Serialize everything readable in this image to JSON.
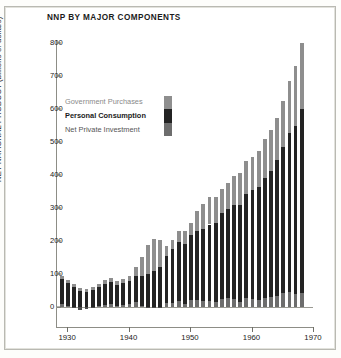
{
  "chart_data": {
    "type": "bar",
    "stacked": true,
    "title": "NNP BY MAJOR  COMPONENTS",
    "xlabel": "",
    "ylabel": "NET NATIONAL PRODUCT (billions of dollars)",
    "ylim": [
      0,
      820
    ],
    "xlim": [
      1928.2,
      1970
    ],
    "grid": false,
    "legend_position": "inside-upper-left",
    "y_ticks": [
      0,
      100,
      200,
      300,
      400,
      500,
      600,
      700,
      800
    ],
    "x_ticks": [
      1930,
      1940,
      1950,
      1960,
      1970
    ],
    "categories": [
      1929,
      1930,
      1931,
      1932,
      1933,
      1934,
      1935,
      1936,
      1937,
      1938,
      1939,
      1940,
      1941,
      1942,
      1943,
      1944,
      1945,
      1946,
      1947,
      1948,
      1949,
      1950,
      1951,
      1952,
      1953,
      1954,
      1955,
      1956,
      1957,
      1958,
      1959,
      1960,
      1961,
      1962,
      1963,
      1964,
      1965,
      1966,
      1967,
      1968
    ],
    "series": [
      {
        "name": "Net Private Investment",
        "color": "#6d6d6d",
        "stack_order": 1,
        "values": [
          9,
          3,
          -3,
          -8,
          -6,
          -1,
          4,
          7,
          10,
          2,
          5,
          9,
          14,
          4,
          -3,
          -2,
          -3,
          12,
          12,
          19,
          10,
          22,
          21,
          17,
          17,
          16,
          25,
          26,
          24,
          16,
          26,
          24,
          22,
          28,
          30,
          33,
          42,
          46,
          39,
          42
        ]
      },
      {
        "name": "Personal Consumption",
        "color": "#232323",
        "stack_order": 2,
        "values": [
          77,
          70,
          61,
          49,
          46,
          52,
          56,
          62,
          67,
          64,
          67,
          71,
          81,
          89,
          100,
          109,
          120,
          144,
          165,
          178,
          181,
          195,
          209,
          219,
          233,
          240,
          259,
          271,
          285,
          294,
          317,
          332,
          342,
          363,
          383,
          412,
          444,
          481,
          509,
          558
        ]
      },
      {
        "name": "Government Purchases",
        "color": "#8e8e8e",
        "stack_order": 3,
        "values": [
          9,
          10,
          9,
          8,
          8,
          10,
          10,
          12,
          12,
          13,
          13,
          14,
          25,
          60,
          89,
          97,
          83,
          28,
          26,
          32,
          39,
          38,
          60,
          76,
          82,
          76,
          75,
          79,
          87,
          95,
          98,
          100,
          108,
          118,
          123,
          129,
          138,
          158,
          181,
          199
        ]
      }
    ],
    "totals": [
      95,
      83,
      67,
      49,
      48,
      61,
      70,
      81,
      89,
      79,
      85,
      94,
      120,
      153,
      186,
      204,
      200,
      184,
      203,
      229,
      230,
      255,
      290,
      312,
      332,
      332,
      359,
      376,
      396,
      405,
      441,
      456,
      472,
      509,
      536,
      574,
      624,
      685,
      729,
      789
    ]
  },
  "legend": {
    "items": [
      {
        "label": "Government Purchases",
        "swatch": "gov-swatch"
      },
      {
        "label": "Personal Consumption",
        "swatch": "pc-swatch"
      },
      {
        "label": "Net Private Investment",
        "swatch": "inv-swatch"
      }
    ]
  },
  "colors": {
    "government": "#8e8e8e",
    "consumption": "#232323",
    "investment": "#6d6d6d",
    "axis": "#8d8d86",
    "text": "#1b1b1b",
    "frame": "#b9b9b2"
  }
}
